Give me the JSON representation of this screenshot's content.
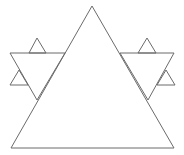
{
  "figure": {
    "stroke_color": "#6b6b6b",
    "background": "#ffffff",
    "shapes": [
      {
        "name": "large-triangle",
        "points": "92,6 11,148 174,148"
      },
      {
        "name": "left-inverted-triangle",
        "points": "10,53 65,53 37,100"
      },
      {
        "name": "left-top-small-triangle",
        "points": "29,53 37,38 46,53"
      },
      {
        "name": "left-side-small-triangle",
        "points": "10,85 19,70 28,85"
      },
      {
        "name": "right-inverted-triangle",
        "points": "120,53 174,53 148,100"
      },
      {
        "name": "right-top-small-triangle",
        "points": "138,53 147,38 156,53"
      },
      {
        "name": "right-side-small-triangle",
        "points": "157,85 166,70 175,85"
      }
    ]
  }
}
